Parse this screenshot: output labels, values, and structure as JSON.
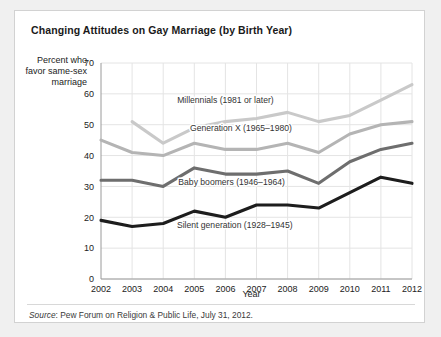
{
  "card": {
    "title": "Changing Attitudes on Gay Marriage (by Birth Year)",
    "source_prefix": "Source",
    "source_text": ": Pew Forum on Religion & Public Life, July 31, 2012."
  },
  "chart_data": {
    "type": "line",
    "title": "Changing Attitudes on Gay Marriage (by Birth Year)",
    "xlabel": "Year",
    "ylabel": "Percent who favor same-sex marriage",
    "categories": [
      2002,
      2003,
      2004,
      2005,
      2006,
      2007,
      2008,
      2009,
      2010,
      2011,
      2012
    ],
    "x": [
      "2002",
      "2003",
      "2004",
      "2005",
      "2006",
      "2007",
      "2008",
      "2009",
      "2010",
      "2011",
      "2012"
    ],
    "xlim": [
      2002,
      2012
    ],
    "ylim": [
      0,
      70
    ],
    "yticks": [
      0,
      10,
      20,
      30,
      40,
      50,
      60,
      70
    ],
    "ytick_labels": [
      "0",
      "10",
      "20",
      "30",
      "40",
      "50",
      "60",
      "70"
    ],
    "grid": true,
    "legend": "inline-annotations",
    "series": [
      {
        "name": "Millennials (1981 or later)",
        "color": "#c9c9c9",
        "x": [
          2003,
          2004,
          2005,
          2006,
          2007,
          2008,
          2009,
          2010,
          2011,
          2012
        ],
        "values": [
          51,
          44,
          49,
          51,
          52,
          54,
          51,
          53,
          58,
          63
        ],
        "label_x": 2006,
        "label_y": 57
      },
      {
        "name": "Generation X (1965–1980)",
        "color": "#b4b4b4",
        "x": [
          2002,
          2003,
          2004,
          2005,
          2006,
          2007,
          2008,
          2009,
          2010,
          2011,
          2012
        ],
        "values": [
          45,
          41,
          40,
          44,
          42,
          42,
          44,
          41,
          47,
          50,
          51
        ],
        "label_x": 2006.5,
        "label_y": 48
      },
      {
        "name": "Baby boomers (1946–1964)",
        "color": "#6e6e6e",
        "x": [
          2002,
          2003,
          2004,
          2005,
          2006,
          2007,
          2008,
          2009,
          2010,
          2011,
          2012
        ],
        "values": [
          32,
          32,
          30,
          36,
          34,
          34,
          35,
          31,
          38,
          42,
          44
        ],
        "label_x": 2006.2,
        "label_y": 30.5
      },
      {
        "name": "Silent generation (1928–1945)",
        "color": "#1d1d1d",
        "x": [
          2002,
          2003,
          2004,
          2005,
          2006,
          2007,
          2008,
          2009,
          2010,
          2011,
          2012
        ],
        "values": [
          19,
          17,
          18,
          22,
          20,
          24,
          24,
          23,
          28,
          33,
          31
        ],
        "label_x": 2006.3,
        "label_y": 16.5
      }
    ]
  }
}
